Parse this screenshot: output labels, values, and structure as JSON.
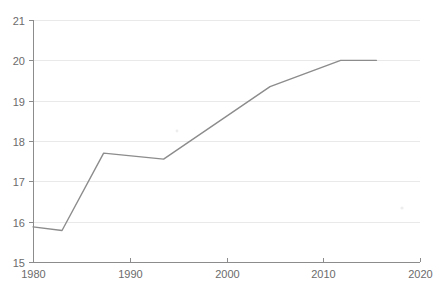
{
  "chart_data": {
    "type": "line",
    "title": "",
    "subtitle": "",
    "xlabel": "",
    "ylabel": "",
    "xlim": [
      1980,
      2020
    ],
    "ylim": [
      15,
      21
    ],
    "grid": "horizontal",
    "legend": "none",
    "line_color": "#8c8c8c",
    "gridline_color": "#e9e9e9",
    "axis_color": "#8c8c8c",
    "tick_label_color": "#6b6b6b",
    "background_color": "#ffffff",
    "x_ticks": [
      {
        "value": 1980,
        "label": "1980"
      },
      {
        "value": 1990,
        "label": "1990"
      },
      {
        "value": 2000,
        "label": "2000"
      },
      {
        "value": 2010,
        "label": "2010"
      },
      {
        "value": 2020,
        "label": "2020"
      }
    ],
    "y_ticks": [
      {
        "value": 21,
        "label": "21"
      },
      {
        "value": 20,
        "label": "20"
      },
      {
        "value": 19,
        "label": "19"
      },
      {
        "value": 18,
        "label": "18"
      },
      {
        "value": 17,
        "label": "17"
      },
      {
        "value": 16,
        "label": "16"
      },
      {
        "value": 15,
        "label": "15"
      }
    ],
    "series": [
      {
        "name": "series-1",
        "color": "#8c8c8c",
        "x": [
          1980.0,
          1983.0,
          1987.3,
          1993.5,
          2004.5,
          2011.8,
          2015.5
        ],
        "values": [
          15.87,
          15.78,
          17.7,
          17.55,
          19.35,
          20.0,
          20.0
        ]
      }
    ],
    "annotations": []
  }
}
